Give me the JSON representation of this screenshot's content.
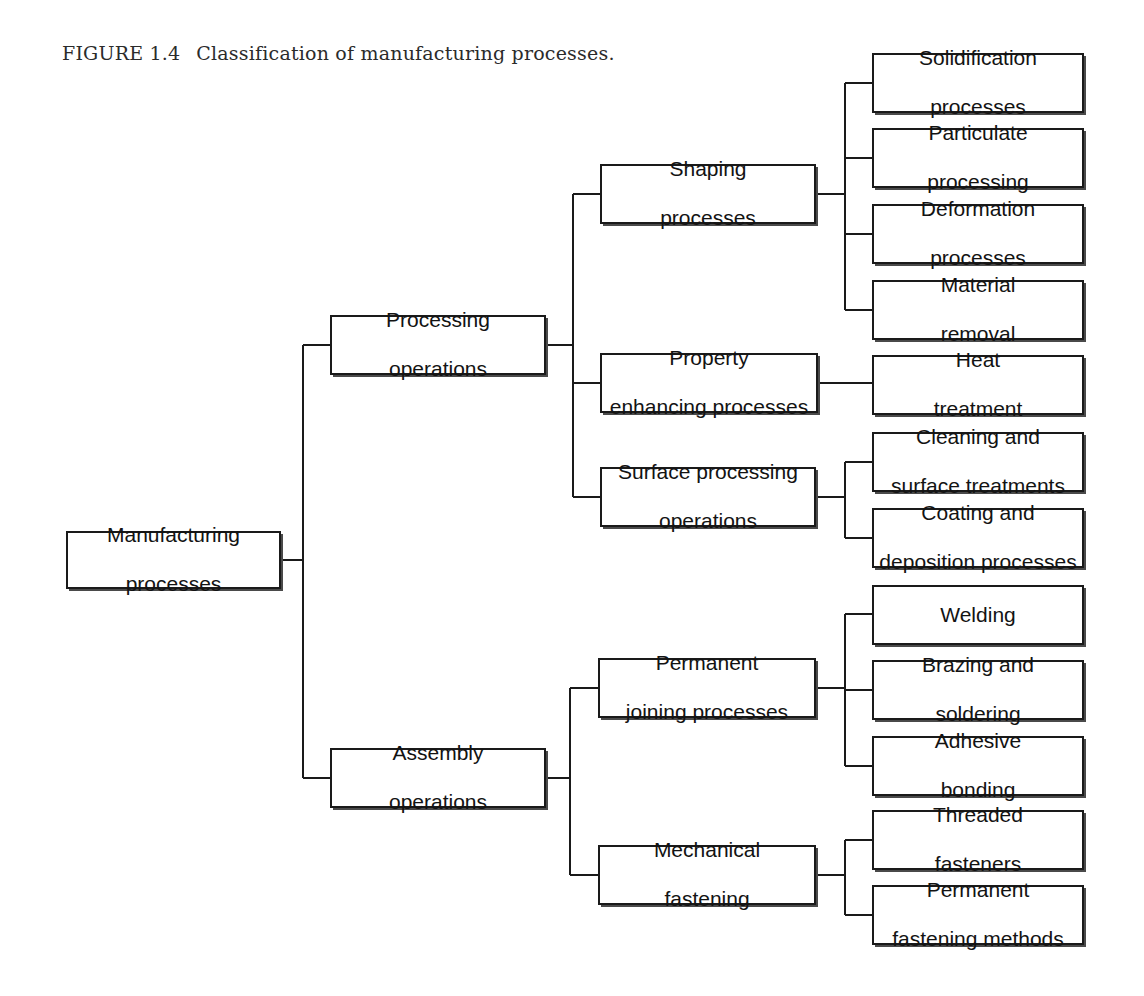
{
  "figure": {
    "label": "FIGURE 1.4",
    "caption": "Classification of manufacturing processes."
  },
  "diagram": {
    "type": "tree",
    "orientation": "left-to-right",
    "line_color": "#1a1a1a",
    "box_fill": "#ffffff",
    "nodes": {
      "root": {
        "label": "Manufacturing\nprocesses",
        "line1": "Manufacturing",
        "line2": "processes"
      },
      "processing": {
        "label": "Processing\noperations",
        "line1": "Processing",
        "line2": "operations"
      },
      "assembly": {
        "label": "Assembly\noperations",
        "line1": "Assembly",
        "line2": "operations"
      },
      "shaping": {
        "label": "Shaping\nprocesses",
        "line1": "Shaping",
        "line2": "processes"
      },
      "property": {
        "label": "Property\nenhancing processes",
        "line1": "Property",
        "line2": "enhancing processes"
      },
      "surface": {
        "label": "Surface processing\noperations",
        "line1": "Surface processing",
        "line2": "operations"
      },
      "joining": {
        "label": "Permanent\njoining processes",
        "line1": "Permanent",
        "line2": "joining processes"
      },
      "fastening": {
        "label": "Mechanical\nfastening",
        "line1": "Mechanical",
        "line2": "fastening"
      },
      "solidification": {
        "label": "Solidification\nprocesses",
        "line1": "Solidification",
        "line2": "processes"
      },
      "particulate": {
        "label": "Particulate\nprocessing",
        "line1": "Particulate",
        "line2": "processing"
      },
      "deformation": {
        "label": "Deformation\nprocesses",
        "line1": "Deformation",
        "line2": "processes"
      },
      "material_removal": {
        "label": "Material\nremoval",
        "line1": "Material",
        "line2": "removal"
      },
      "heat_treatment": {
        "label": "Heat\ntreatment",
        "line1": "Heat",
        "line2": "treatment"
      },
      "cleaning": {
        "label": "Cleaning and\nsurface treatments",
        "line1": "Cleaning and",
        "line2": "surface treatments"
      },
      "coating": {
        "label": "Coating and\ndeposition processes",
        "line1": "Coating and",
        "line2": "deposition processes"
      },
      "welding": {
        "label": "Welding",
        "line1": "Welding",
        "line2": ""
      },
      "brazing": {
        "label": "Brazing and\nsoldering",
        "line1": "Brazing and",
        "line2": "soldering"
      },
      "adhesive": {
        "label": "Adhesive\nbonding",
        "line1": "Adhesive",
        "line2": "bonding"
      },
      "threaded": {
        "label": "Threaded\nfasteners",
        "line1": "Threaded",
        "line2": "fasteners"
      },
      "permanent_fastening": {
        "label": "Permanent\nfastening methods",
        "line1": "Permanent",
        "line2": "fastening methods"
      }
    }
  }
}
